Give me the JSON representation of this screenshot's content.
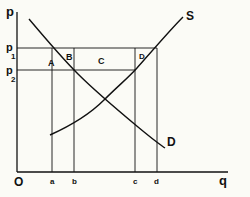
{
  "diagram": {
    "type": "supply-demand",
    "axes": {
      "y_label": "p",
      "x_label": "q",
      "origin_label": "O"
    },
    "price_levels": [
      {
        "label": "p",
        "subscript": "1"
      },
      {
        "label": "p",
        "subscript": "2"
      }
    ],
    "quantity_levels": [
      "a",
      "b",
      "c",
      "d"
    ],
    "curves": {
      "supply": "S",
      "demand": "D"
    },
    "regions": [
      "A",
      "B",
      "C",
      "D"
    ],
    "colors": {
      "background": "#fbfbf6",
      "ink": "#111111"
    }
  }
}
